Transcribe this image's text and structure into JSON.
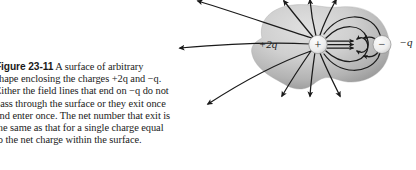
{
  "figure": {
    "label": "Figure 23-11",
    "caption_lines": [
      "A surface of arbitrary",
      "shape enclosing the charges +2q and −q.",
      "Either the field lines that end on −q do not",
      "pass through the surface or they exit once",
      "and enter once. The net number that exit is",
      "the same as that for a single charge equal",
      "to the net charge within the surface."
    ],
    "caption_full": "Figure 23-11 A surface of arbitrary shape enclosing the charges +2q and −q. Either the field lines that end on −q do not pass through the surface or they exit once and enter once. The net number that exit is the same as that for a single charge equal to the net charge within the surface."
  },
  "diagram": {
    "positive_charge": {
      "symbol": "+",
      "label": "+2q",
      "label_sign": "+",
      "label_magnitude": "2",
      "label_variable": "q"
    },
    "negative_charge": {
      "symbol": "−",
      "label": "−q",
      "label_sign": "−",
      "label_variable": "q"
    },
    "surface": {
      "name": "gaussian-surface",
      "description": "arbitrary closed surface",
      "fill_light": "#dcdcdc",
      "fill_mid": "#c4c4c4",
      "fill_dark": "#9a9a9a"
    },
    "field_lines": {
      "color": "#1a1a1a",
      "arrow_count": 14,
      "description": "electric field lines from +2q, some terminating on −q"
    }
  }
}
